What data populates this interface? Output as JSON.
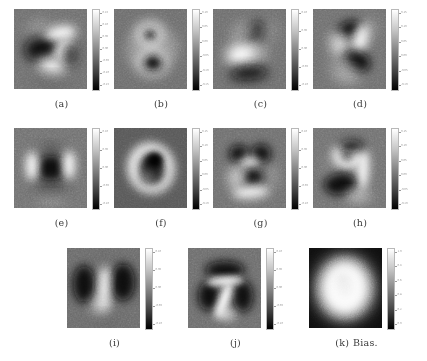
{
  "figure": {
    "title": "",
    "kind": "grayscale weight heatmap grid",
    "colormap": "gray",
    "rows": [
      {
        "row_id": "row-1",
        "panels": [
          {
            "label": "(a)",
            "name": "",
            "digit_hint": "2",
            "colorbar": {
              "ticks": [
                "0.15",
                "0.10",
                "0.05",
                "0.00",
                "-0.05",
                "-0.10",
                "-0.15"
              ]
            }
          },
          {
            "label": "(b)",
            "name": "",
            "digit_hint": "8",
            "colorbar": {
              "ticks": [
                "0.10",
                "0.05",
                "0.00",
                "-0.05",
                "-0.10",
                "-0.15"
              ]
            }
          },
          {
            "label": "(c)",
            "name": "",
            "digit_hint": "4",
            "colorbar": {
              "ticks": [
                "0.10",
                "0.05",
                "0.00",
                "-0.05",
                "-0.10"
              ]
            }
          },
          {
            "label": "(d)",
            "name": "",
            "digit_hint": "7",
            "colorbar": {
              "ticks": [
                "0.15",
                "0.10",
                "0.05",
                "0.00",
                "-0.05",
                "-0.10"
              ]
            }
          }
        ]
      },
      {
        "row_id": "row-2",
        "panels": [
          {
            "label": "(e)",
            "name": "",
            "digit_hint": "0",
            "colorbar": {
              "ticks": [
                "0.10",
                "0.05",
                "0.00",
                "-0.05",
                "-0.10"
              ]
            }
          },
          {
            "label": "(f)",
            "name": "",
            "digit_hint": "0",
            "colorbar": {
              "ticks": [
                "0.15",
                "0.10",
                "0.05",
                "0.00",
                "-0.05",
                "-0.10"
              ]
            }
          },
          {
            "label": "(g)",
            "name": "",
            "digit_hint": "6",
            "colorbar": {
              "ticks": [
                "0.10",
                "0.05",
                "0.00",
                "-0.05",
                "-0.10"
              ]
            }
          },
          {
            "label": "(h)",
            "name": "",
            "digit_hint": "9",
            "colorbar": {
              "ticks": [
                "0.15",
                "0.10",
                "0.05",
                "0.00",
                "-0.05",
                "-0.10"
              ]
            }
          }
        ]
      },
      {
        "row_id": "row-3",
        "panels": [
          {
            "label": "(i)",
            "name": "",
            "digit_hint": "1",
            "colorbar": {
              "ticks": [
                "0.10",
                "0.05",
                "0.00",
                "-0.05",
                "-0.10"
              ]
            }
          },
          {
            "label": "(j)",
            "name": "",
            "digit_hint": "7",
            "colorbar": {
              "ticks": [
                "0.10",
                "0.05",
                "0.00",
                "-0.05",
                "-0.10"
              ]
            }
          },
          {
            "label": "(k)",
            "name": "Bias.",
            "digit_hint": "bias",
            "colorbar": {
              "ticks": [
                "1.0",
                "0.8",
                "0.6",
                "0.4",
                "0.2",
                "0.0"
              ]
            }
          }
        ]
      }
    ]
  },
  "colors": {
    "page_background": "#ffffff",
    "caption_text": "#3b3b3b",
    "heatmap_mid": "#777777",
    "heatmap_high": "#ffffff",
    "heatmap_low": "#000000",
    "colorbar_tick": "#8d8d8d"
  }
}
